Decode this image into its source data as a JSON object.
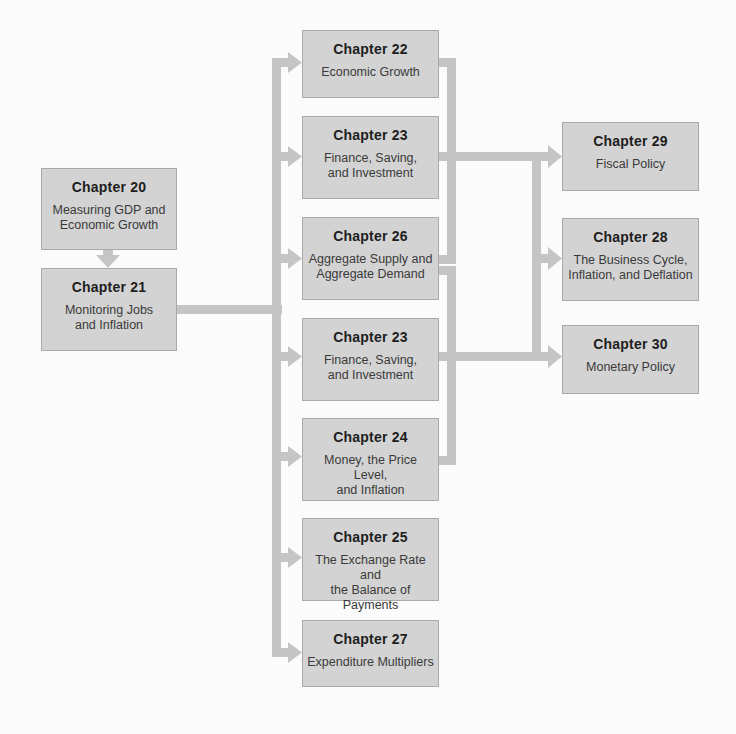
{
  "colors": {
    "background": "#fbfbfb",
    "box_fill": "#d3d3d3",
    "box_border": "#a9a9a9",
    "connector": "#c5c5c5",
    "text_heading": "#1e1e1e",
    "text_body": "#3a3a3a"
  },
  "left_column": [
    {
      "id": "ch20",
      "number": "Chapter 20",
      "title_lines": [
        "Measuring GDP and",
        "Economic Growth"
      ]
    },
    {
      "id": "ch21",
      "number": "Chapter 21",
      "title_lines": [
        "Monitoring Jobs",
        "and Inflation"
      ]
    }
  ],
  "middle_column": [
    {
      "id": "ch22",
      "number": "Chapter 22",
      "title_lines": [
        "Economic Growth"
      ]
    },
    {
      "id": "ch23a",
      "number": "Chapter 23",
      "title_lines": [
        "Finance, Saving,",
        "and Investment"
      ]
    },
    {
      "id": "ch26",
      "number": "Chapter 26",
      "title_lines": [
        "Aggregate Supply and",
        "Aggregate Demand"
      ]
    },
    {
      "id": "ch23b",
      "number": "Chapter 23",
      "title_lines": [
        "Finance, Saving,",
        "and Investment"
      ]
    },
    {
      "id": "ch24",
      "number": "Chapter 24",
      "title_lines": [
        "Money, the Price Level,",
        "and Inflation"
      ]
    },
    {
      "id": "ch25",
      "number": "Chapter 25",
      "title_lines": [
        "The Exchange Rate and",
        "the Balance of Payments"
      ]
    },
    {
      "id": "ch27",
      "number": "Chapter 27",
      "title_lines": [
        "Expenditure Multipliers"
      ]
    }
  ],
  "right_column": [
    {
      "id": "ch29",
      "number": "Chapter 29",
      "title_lines": [
        "Fiscal Policy"
      ]
    },
    {
      "id": "ch28",
      "number": "Chapter 28",
      "title_lines": [
        "The Business Cycle,",
        "Inflation, and Deflation"
      ]
    },
    {
      "id": "ch30",
      "number": "Chapter 30",
      "title_lines": [
        "Monetary Policy"
      ]
    }
  ],
  "edges": [
    {
      "from": "Chapter 20",
      "to": "Chapter 21"
    },
    {
      "from": "Chapter 21",
      "to": "Chapter 22"
    },
    {
      "from": "Chapter 21",
      "to": "Chapter 23"
    },
    {
      "from": "Chapter 21",
      "to": "Chapter 26"
    },
    {
      "from": "Chapter 21",
      "to": "Chapter 23"
    },
    {
      "from": "Chapter 21",
      "to": "Chapter 24"
    },
    {
      "from": "Chapter 21",
      "to": "Chapter 25"
    },
    {
      "from": "Chapter 21",
      "to": "Chapter 27"
    },
    {
      "from": "Chapter 22 + Chapter 23 + Chapter 26",
      "to": "Chapter 29 / Chapter 28 / Chapter 30"
    },
    {
      "from": "Chapter 26 + Chapter 23 + Chapter 24",
      "to": "Chapter 30 / Chapter 28 / Chapter 29"
    }
  ]
}
